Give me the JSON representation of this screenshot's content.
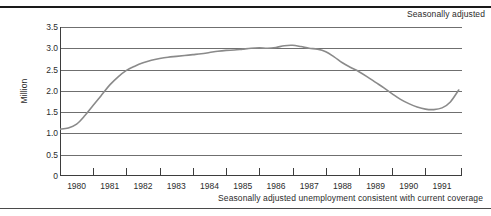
{
  "figure": {
    "top_note": "Seasonally adjusted",
    "caption": "Seasonally adjusted unemployment consistent with current coverage"
  },
  "chart_data": {
    "type": "line",
    "title": "",
    "subtitle": "",
    "annotations": [
      "Seasonally adjusted"
    ],
    "xlabel": "",
    "ylabel": "Million",
    "ylim": [
      0,
      3.5
    ],
    "xlim": [
      1979.5,
      1991.6
    ],
    "grid": true,
    "grid_axis": "y",
    "legend": false,
    "legend_position": "none",
    "yticks": [
      0,
      0.5,
      1.0,
      1.5,
      2.0,
      2.5,
      3.0,
      3.5
    ],
    "ytick_labels": [
      "0",
      "0.5",
      "1.0",
      "1.5",
      "2.0",
      "2.5",
      "3.0",
      "3.5"
    ],
    "xtick_labels": [
      "1980",
      "1981",
      "1982",
      "1983",
      "1984",
      "1985",
      "1986",
      "1987",
      "1988",
      "1989",
      "1990",
      "1991"
    ],
    "xtick_positions": [
      1980,
      1981,
      1982,
      1983,
      1984,
      1985,
      1986,
      1987,
      1988,
      1989,
      1990,
      1991
    ],
    "series": [
      {
        "name": "Seasonally adjusted unemployment consistent with current coverage",
        "color": "#8a8a8a",
        "x": [
          1979.5,
          1979.75,
          1980.0,
          1980.25,
          1980.5,
          1980.75,
          1981.0,
          1981.25,
          1981.5,
          1981.75,
          1982.0,
          1982.25,
          1982.5,
          1982.75,
          1983.0,
          1983.25,
          1983.5,
          1983.75,
          1984.0,
          1984.25,
          1984.5,
          1984.75,
          1985.0,
          1985.25,
          1985.5,
          1985.75,
          1986.0,
          1986.25,
          1986.5,
          1986.75,
          1987.0,
          1987.25,
          1987.5,
          1987.75,
          1988.0,
          1988.25,
          1988.5,
          1988.75,
          1989.0,
          1989.25,
          1989.5,
          1989.75,
          1990.0,
          1990.25,
          1990.5,
          1990.75,
          1991.0,
          1991.25,
          1991.5
        ],
        "y": [
          1.1,
          1.13,
          1.22,
          1.42,
          1.66,
          1.9,
          2.14,
          2.33,
          2.48,
          2.58,
          2.66,
          2.72,
          2.76,
          2.79,
          2.81,
          2.83,
          2.85,
          2.87,
          2.9,
          2.93,
          2.95,
          2.96,
          2.98,
          3.0,
          3.01,
          3.0,
          3.02,
          3.06,
          3.07,
          3.04,
          3.0,
          2.98,
          2.92,
          2.8,
          2.66,
          2.55,
          2.45,
          2.33,
          2.2,
          2.07,
          1.93,
          1.8,
          1.7,
          1.62,
          1.57,
          1.56,
          1.6,
          1.74,
          2.02
        ]
      }
    ]
  }
}
